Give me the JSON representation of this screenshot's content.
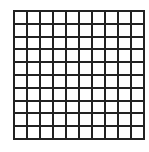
{
  "grid": {
    "rows": 10,
    "columns": 10,
    "line_color": "#222222",
    "cell_color": "#ffffff"
  }
}
